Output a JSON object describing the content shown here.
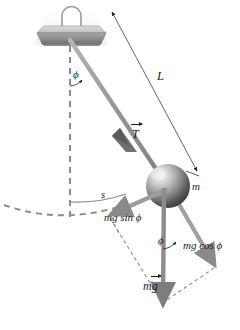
{
  "figure": {
    "canvas": {
      "width": 240,
      "height": 330,
      "background": "#ffffff"
    }
  },
  "labels": {
    "length": "L",
    "tension": "T",
    "mass": "m",
    "arc_length": "s",
    "angle_top": "ϕ",
    "angle_bottom": "ϕ",
    "weight": "mg",
    "weight_prefix": "m",
    "weight_vector_symbol": "g",
    "tangential_component": "mg sin ϕ",
    "radial_component": "mg cos ϕ"
  },
  "colors": {
    "ink": "#1b1b1b",
    "string": "#9a9a9a",
    "string_dark": "#6f6f6f",
    "dashed_guide": "#8c8c8c",
    "dashed_construction": "#8a8a8a",
    "mount_top": "#c9c9c9",
    "mount_face": "#8e8e8e",
    "mount_side": "#6d6d6d",
    "mount_glow": "#efefef",
    "bob_light": "#e8e8e8",
    "bob_mid": "#8d8d8d",
    "bob_dark": "#3a3a3a",
    "thin_rule": "#4a4a4a",
    "arc_solid": "#8f8f8f"
  },
  "geometry": {
    "pivot": {
      "x": 70,
      "y": 41
    },
    "bob_center": {
      "x": 168,
      "y": 186
    },
    "bob_radius": 22,
    "vertical_dashed": {
      "x": 70,
      "y_start": 46,
      "y_end": 218
    },
    "length_line": {
      "x1": 112,
      "y1": 12,
      "x2": 197,
      "y2": 171
    },
    "weight_tip": {
      "x": 163,
      "y": 307
    },
    "cos_tip": {
      "x": 216,
      "y": 266
    },
    "sin_tip": {
      "x": 113,
      "y": 232
    }
  },
  "annotations": {
    "top_angle_between": "vertical dashed line and pendulum string",
    "bottom_angle_between": "vertical weight vector and mg cos phi component",
    "trajectory": "dashed circular arc showing swing path"
  }
}
